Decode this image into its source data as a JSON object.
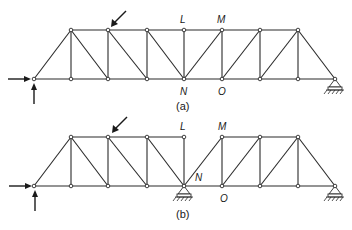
{
  "diagrams": [
    {
      "id": "a",
      "caption": "(a)",
      "labels": {
        "L": "L",
        "M": "M",
        "N": "N",
        "O": "O"
      }
    },
    {
      "id": "b",
      "caption": "(b)",
      "labels": {
        "L": "L",
        "M": "M",
        "N": "N",
        "O": "O"
      }
    }
  ],
  "colors": {
    "line": "#2a2a2a",
    "background": "#ffffff"
  }
}
